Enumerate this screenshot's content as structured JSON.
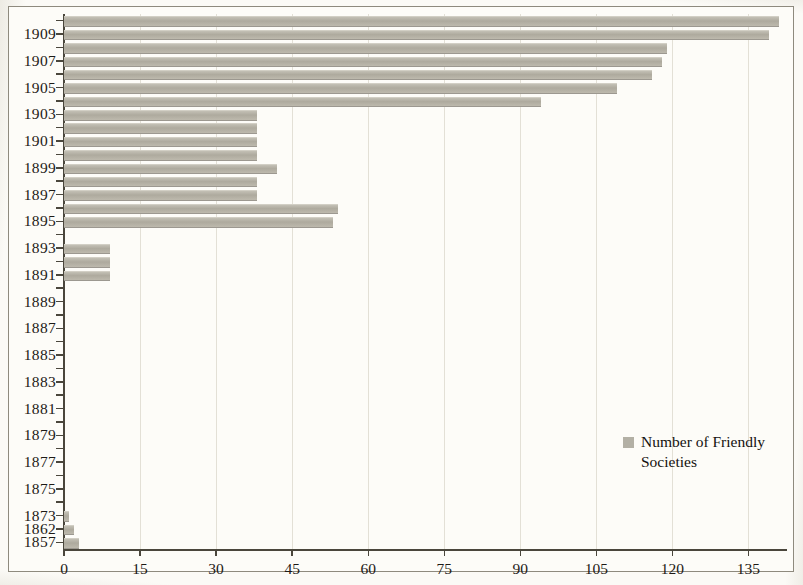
{
  "chart_data": {
    "type": "bar",
    "orientation": "horizontal",
    "title": "",
    "subtitle": "",
    "xlabel": "",
    "ylabel": "",
    "xlim": [
      0,
      142
    ],
    "ylim": null,
    "grid": true,
    "grid_axis": "x",
    "legend": {
      "position": "inside-right",
      "entries": [
        {
          "name": "Number of Friendly Societies",
          "color": "#b3b0a5"
        }
      ]
    },
    "xticks": [
      0,
      15,
      30,
      45,
      60,
      75,
      90,
      105,
      120,
      135
    ],
    "xtick_labels": [
      "0",
      "15",
      "30",
      "45",
      "60",
      "75",
      "90",
      "105",
      "120",
      "135"
    ],
    "categories": [
      "1910",
      "1909",
      "1908",
      "1907",
      "1906",
      "1905",
      "1904",
      "1903",
      "1902",
      "1901",
      "1900",
      "1899",
      "1898",
      "1897",
      "1896",
      "1895",
      "1894",
      "1893",
      "1892",
      "1891",
      "1890",
      "1889",
      "1888",
      "1887",
      "1886",
      "1885",
      "1884",
      "1883",
      "1882",
      "1881",
      "1880",
      "1879",
      "1878",
      "1877",
      "1876",
      "1875",
      "1874",
      "1873",
      "1862",
      "1857"
    ],
    "visible_ytick_labels": [
      "1909",
      "1907",
      "1905",
      "1903",
      "1901",
      "1899",
      "1897",
      "1895",
      "1893",
      "1891",
      "1889",
      "1887",
      "1885",
      "1883",
      "1881",
      "1879",
      "1877",
      "1875",
      "1873",
      "1862",
      "1857"
    ],
    "series": [
      {
        "name": "Number of Friendly Societies",
        "color": "#b3b0a5",
        "values": [
          141,
          139,
          119,
          118,
          116,
          109,
          94,
          38,
          38,
          38,
          38,
          42,
          38,
          38,
          54,
          53,
          0,
          9,
          9,
          9,
          0,
          0,
          0,
          0,
          0,
          0,
          0,
          0,
          0,
          0,
          0,
          0,
          0,
          0,
          0,
          0,
          0,
          1,
          2,
          3
        ]
      }
    ]
  },
  "legend": {
    "label": "Number of Friendly Societies"
  }
}
